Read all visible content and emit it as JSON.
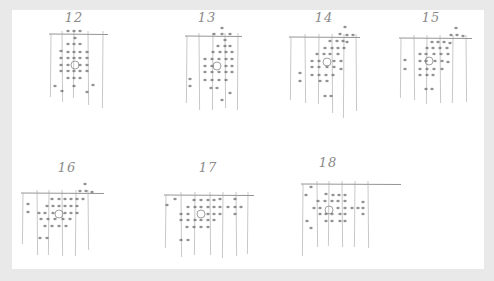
{
  "page": {
    "background": "#e9e9e9",
    "paper_color": "#ffffff",
    "ink_color": "#7a7a7a",
    "dot_color": "#6e6e6e"
  },
  "sketches": [
    {
      "label": "12",
      "label_pos": [
        74,
        20
      ],
      "frame": {
        "top_y": 34,
        "left_x": 51,
        "right_x": 104,
        "bottom_y": 105,
        "verticals": [
          51,
          62,
          74,
          88,
          103
        ],
        "bottom_ys": [
          97,
          102,
          98,
          105,
          108
        ]
      },
      "target": [
        75,
        65
      ],
      "dots": [
        [
          68,
          31
        ],
        [
          74,
          31
        ],
        [
          80,
          31
        ],
        [
          75,
          38
        ],
        [
          68,
          44
        ],
        [
          74,
          44
        ],
        [
          80,
          44
        ],
        [
          61,
          51
        ],
        [
          68,
          52
        ],
        [
          74,
          52
        ],
        [
          80,
          52
        ],
        [
          87,
          52
        ],
        [
          61,
          58
        ],
        [
          68,
          58
        ],
        [
          74,
          58
        ],
        [
          80,
          58
        ],
        [
          87,
          58
        ],
        [
          61,
          65
        ],
        [
          68,
          65
        ],
        [
          80,
          65
        ],
        [
          87,
          65
        ],
        [
          61,
          71
        ],
        [
          68,
          71
        ],
        [
          74,
          71
        ],
        [
          80,
          71
        ],
        [
          87,
          71
        ],
        [
          68,
          78
        ],
        [
          74,
          78
        ],
        [
          80,
          78
        ],
        [
          55,
          86
        ],
        [
          74,
          86
        ],
        [
          93,
          85
        ],
        [
          62,
          91
        ],
        [
          87,
          92
        ]
      ]
    },
    {
      "label": "13",
      "label_pos": [
        207,
        20
      ],
      "frame": {
        "top_y": 36,
        "left_x": 187,
        "right_x": 238,
        "bottom_y": 110,
        "verticals": [
          187,
          199,
          213,
          225,
          238
        ],
        "bottom_ys": [
          103,
          110,
          110,
          108,
          110
        ]
      },
      "target": [
        217,
        66
      ],
      "dots": [
        [
          222,
          28
        ],
        [
          214,
          34
        ],
        [
          222,
          34
        ],
        [
          230,
          34
        ],
        [
          225,
          40
        ],
        [
          218,
          46
        ],
        [
          225,
          46
        ],
        [
          230,
          46
        ],
        [
          213,
          52
        ],
        [
          220,
          52
        ],
        [
          226,
          52
        ],
        [
          232,
          52
        ],
        [
          205,
          59
        ],
        [
          212,
          59
        ],
        [
          219,
          59
        ],
        [
          226,
          59
        ],
        [
          232,
          59
        ],
        [
          205,
          66
        ],
        [
          212,
          66
        ],
        [
          226,
          66
        ],
        [
          232,
          66
        ],
        [
          205,
          72
        ],
        [
          212,
          72
        ],
        [
          219,
          72
        ],
        [
          226,
          72
        ],
        [
          232,
          72
        ],
        [
          205,
          80
        ],
        [
          212,
          80
        ],
        [
          219,
          80
        ],
        [
          226,
          80
        ],
        [
          211,
          88
        ],
        [
          217,
          88
        ],
        [
          190,
          79
        ],
        [
          190,
          86
        ],
        [
          230,
          93
        ],
        [
          222,
          100
        ]
      ]
    },
    {
      "label": "14",
      "label_pos": [
        324,
        20
      ],
      "frame": {
        "top_y": 37,
        "left_x": 291,
        "right_x": 356,
        "bottom_y": 115,
        "verticals": [
          291,
          305,
          319,
          332,
          344,
          356
        ],
        "bottom_ys": [
          100,
          103,
          104,
          113,
          118,
          111
        ]
      },
      "target": [
        327,
        62
      ],
      "dots": [
        [
          345,
          27
        ],
        [
          340,
          34
        ],
        [
          347,
          35
        ],
        [
          353,
          35
        ],
        [
          330,
          41
        ],
        [
          337,
          41
        ],
        [
          343,
          41
        ],
        [
          347,
          42
        ],
        [
          325,
          48
        ],
        [
          332,
          48
        ],
        [
          338,
          48
        ],
        [
          344,
          48
        ],
        [
          317,
          54
        ],
        [
          324,
          54
        ],
        [
          330,
          54
        ],
        [
          338,
          54
        ],
        [
          312,
          61
        ],
        [
          319,
          61
        ],
        [
          334,
          61
        ],
        [
          341,
          61
        ],
        [
          312,
          67
        ],
        [
          319,
          67
        ],
        [
          327,
          67
        ],
        [
          334,
          67
        ],
        [
          341,
          69
        ],
        [
          312,
          75
        ],
        [
          319,
          75
        ],
        [
          326,
          75
        ],
        [
          333,
          75
        ],
        [
          320,
          81
        ],
        [
          327,
          81
        ],
        [
          300,
          73
        ],
        [
          300,
          81
        ],
        [
          325,
          96
        ],
        [
          331,
          96
        ]
      ]
    },
    {
      "label": "15",
      "label_pos": [
        431,
        20
      ],
      "frame": {
        "top_y": 38,
        "left_x": 401,
        "right_x": 468,
        "bottom_y": 105,
        "verticals": [
          401,
          414,
          427,
          440,
          453,
          466
        ],
        "bottom_ys": [
          98,
          100,
          104,
          103,
          103,
          102
        ]
      },
      "target": [
        429,
        61
      ],
      "dots": [
        [
          456,
          28
        ],
        [
          451,
          35
        ],
        [
          457,
          35
        ],
        [
          463,
          36
        ],
        [
          432,
          42
        ],
        [
          438,
          42
        ],
        [
          444,
          42
        ],
        [
          450,
          43
        ],
        [
          427,
          48
        ],
        [
          433,
          48
        ],
        [
          440,
          48
        ],
        [
          447,
          48
        ],
        [
          420,
          54
        ],
        [
          426,
          54
        ],
        [
          434,
          54
        ],
        [
          441,
          54
        ],
        [
          448,
          54
        ],
        [
          420,
          61
        ],
        [
          426,
          61
        ],
        [
          435,
          61
        ],
        [
          442,
          61
        ],
        [
          448,
          62
        ],
        [
          420,
          69
        ],
        [
          427,
          69
        ],
        [
          434,
          69
        ],
        [
          442,
          69
        ],
        [
          420,
          75
        ],
        [
          427,
          75
        ],
        [
          433,
          75
        ],
        [
          426,
          89
        ],
        [
          432,
          89
        ],
        [
          405,
          60
        ],
        [
          405,
          69
        ]
      ]
    },
    {
      "label": "16",
      "label_pos": [
        67,
        170
      ],
      "frame": {
        "top_y": 193,
        "left_x": 23,
        "right_x": 100,
        "bottom_y": 255,
        "verticals": [
          23,
          37,
          49,
          62,
          76,
          88
        ],
        "bottom_ys": [
          244,
          255,
          255,
          256,
          256,
          250
        ]
      },
      "target": [
        59,
        214
      ],
      "dots": [
        [
          85,
          184
        ],
        [
          80,
          191
        ],
        [
          86,
          191
        ],
        [
          92,
          192
        ],
        [
          52,
          199
        ],
        [
          59,
          199
        ],
        [
          65,
          199
        ],
        [
          71,
          199
        ],
        [
          77,
          199
        ],
        [
          83,
          199
        ],
        [
          47,
          206
        ],
        [
          53,
          206
        ],
        [
          59,
          206
        ],
        [
          65,
          206
        ],
        [
          71,
          206
        ],
        [
          77,
          206
        ],
        [
          39,
          213
        ],
        [
          45,
          213
        ],
        [
          53,
          213
        ],
        [
          65,
          213
        ],
        [
          71,
          213
        ],
        [
          77,
          213
        ],
        [
          41,
          219
        ],
        [
          48,
          219
        ],
        [
          55,
          219
        ],
        [
          63,
          219
        ],
        [
          70,
          219
        ],
        [
          45,
          226
        ],
        [
          52,
          226
        ],
        [
          59,
          226
        ],
        [
          66,
          226
        ],
        [
          40,
          238
        ],
        [
          47,
          238
        ],
        [
          28,
          204
        ],
        [
          28,
          212
        ]
      ]
    },
    {
      "label": "17",
      "label_pos": [
        208,
        170
      ],
      "frame": {
        "top_y": 195,
        "left_x": 166,
        "right_x": 250,
        "bottom_y": 258,
        "verticals": [
          166,
          181,
          195,
          210,
          223,
          236,
          248
        ],
        "bottom_ys": [
          248,
          257,
          255,
          255,
          258,
          256,
          254
        ]
      },
      "target": [
        201,
        214
      ],
      "dots": [
        [
          175,
          199
        ],
        [
          194,
          200
        ],
        [
          201,
          200
        ],
        [
          208,
          200
        ],
        [
          214,
          200
        ],
        [
          220,
          199
        ],
        [
          235,
          199
        ],
        [
          167,
          205
        ],
        [
          188,
          207
        ],
        [
          195,
          207
        ],
        [
          201,
          207
        ],
        [
          208,
          207
        ],
        [
          214,
          207
        ],
        [
          220,
          207
        ],
        [
          228,
          207
        ],
        [
          235,
          207
        ],
        [
          241,
          207
        ],
        [
          181,
          214
        ],
        [
          188,
          214
        ],
        [
          208,
          214
        ],
        [
          214,
          214
        ],
        [
          220,
          214
        ],
        [
          235,
          214
        ],
        [
          181,
          220
        ],
        [
          188,
          220
        ],
        [
          195,
          220
        ],
        [
          201,
          220
        ],
        [
          208,
          220
        ],
        [
          214,
          220
        ],
        [
          187,
          227
        ],
        [
          194,
          227
        ],
        [
          201,
          227
        ],
        [
          208,
          227
        ],
        [
          181,
          240
        ],
        [
          188,
          240
        ]
      ]
    },
    {
      "label": "18",
      "label_pos": [
        328,
        165
      ],
      "frame": {
        "top_y": 184,
        "left_x": 303,
        "right_x": 397,
        "bottom_y": 256,
        "verticals": [
          303,
          317,
          329,
          342,
          355,
          368
        ],
        "bottom_ys": [
          256,
          247,
          246,
          247,
          247,
          248
        ]
      },
      "target": [
        329,
        210
      ],
      "dots": [
        [
          311,
          187
        ],
        [
          306,
          195
        ],
        [
          326,
          194
        ],
        [
          333,
          195
        ],
        [
          339,
          195
        ],
        [
          345,
          195
        ],
        [
          318,
          201
        ],
        [
          325,
          201
        ],
        [
          332,
          201
        ],
        [
          338,
          201
        ],
        [
          345,
          201
        ],
        [
          314,
          208
        ],
        [
          320,
          208
        ],
        [
          338,
          208
        ],
        [
          345,
          208
        ],
        [
          352,
          208
        ],
        [
          358,
          208
        ],
        [
          363,
          208
        ],
        [
          320,
          214
        ],
        [
          326,
          214
        ],
        [
          332,
          214
        ],
        [
          340,
          214
        ],
        [
          345,
          214
        ],
        [
          326,
          221
        ],
        [
          332,
          221
        ],
        [
          340,
          221
        ],
        [
          345,
          221
        ],
        [
          363,
          202
        ],
        [
          363,
          214
        ],
        [
          307,
          221
        ],
        [
          311,
          228
        ]
      ]
    }
  ]
}
